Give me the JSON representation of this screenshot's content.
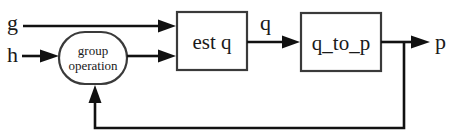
{
  "diagram": {
    "type": "block-diagram",
    "inputs": [
      {
        "id": "g",
        "label": "g"
      },
      {
        "id": "h",
        "label": "h"
      }
    ],
    "blocks": [
      {
        "id": "group_operation",
        "shape": "rounded-ellipse",
        "label_line1": "group",
        "label_line2": "operation"
      },
      {
        "id": "est_q",
        "shape": "rectangle",
        "label": "est q"
      },
      {
        "id": "q_to_p",
        "shape": "rectangle",
        "label": "q_to_p"
      }
    ],
    "signals": {
      "q": "q",
      "p": "p"
    },
    "edges": [
      {
        "from": "g",
        "to": "est_q"
      },
      {
        "from": "h",
        "to": "group_operation"
      },
      {
        "from": "group_operation",
        "to": "est_q"
      },
      {
        "from": "est_q",
        "to": "q_to_p",
        "label": "q"
      },
      {
        "from": "q_to_p",
        "to": "p",
        "label": "p"
      },
      {
        "from": "p",
        "to": "group_operation",
        "label": "feedback"
      }
    ],
    "colors": {
      "line": "#111111",
      "box_border": "#3a3a3a",
      "background": "#ffffff"
    }
  }
}
